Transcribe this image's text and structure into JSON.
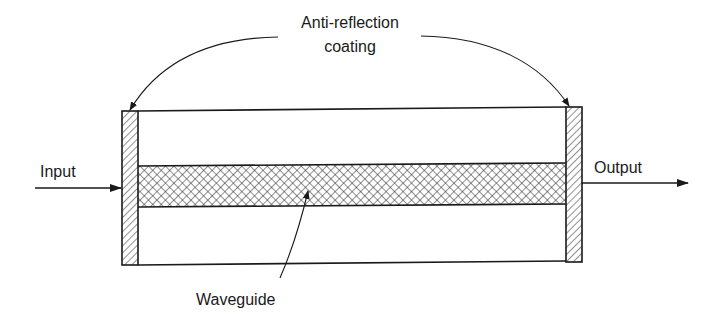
{
  "diagram": {
    "type": "optical-amplifier-schematic",
    "labels": {
      "coating_line1": "Anti-reflection",
      "coating_line2": "coating",
      "input": "Input",
      "output": "Output",
      "waveguide": "Waveguide"
    },
    "components": [
      {
        "id": "left-coating",
        "kind": "anti-reflection coating",
        "pattern": "diagonal-hatch"
      },
      {
        "id": "right-coating",
        "kind": "anti-reflection coating",
        "pattern": "diagonal-hatch"
      },
      {
        "id": "waveguide",
        "kind": "waveguide",
        "pattern": "cross-hatch"
      },
      {
        "id": "body",
        "kind": "chip body",
        "pattern": "none"
      }
    ],
    "arrows": [
      {
        "from": "Input",
        "to": "left-coating",
        "direction": "right"
      },
      {
        "from": "right-coating",
        "to": "Output",
        "direction": "right"
      },
      {
        "from": "coating label",
        "to": "left-coating",
        "style": "curved"
      },
      {
        "from": "coating label",
        "to": "right-coating",
        "style": "curved"
      },
      {
        "from": "Waveguide label",
        "to": "waveguide",
        "style": "curved"
      }
    ],
    "colors": {
      "stroke": "#1a1a1a",
      "background": "#ffffff"
    }
  }
}
